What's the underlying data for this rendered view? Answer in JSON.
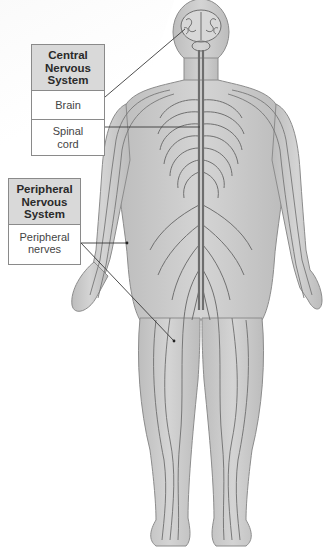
{
  "diagram": {
    "groups": [
      {
        "heading": "Central Nervous System",
        "heading_lines": [
          "Central",
          "Nervous",
          "System"
        ],
        "items": [
          {
            "label": "Brain",
            "lines": [
              "Brain"
            ]
          },
          {
            "label": "Spinal cord",
            "lines": [
              "Spinal",
              "cord"
            ]
          }
        ]
      },
      {
        "heading": "Peripheral Nervous System",
        "heading_lines": [
          "Peripheral",
          "Nervous",
          "System"
        ],
        "items": [
          {
            "label": "Peripheral nerves",
            "lines": [
              "Peripheral",
              "nerves"
            ]
          }
        ]
      }
    ],
    "colors": {
      "body_fill": "#c9c9c9",
      "body_outline": "#8c8c8c",
      "nerve": "#6e6e6e",
      "header_fill": "#d9d9d9",
      "leader_line": "#3a3a3a"
    }
  }
}
